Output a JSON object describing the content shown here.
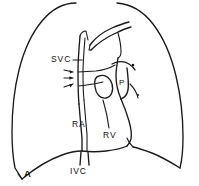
{
  "figure": {
    "panel_label": "A",
    "caption_text": "",
    "background_color": "#ffffff",
    "ink_color": "#1a1a1a",
    "width_px": 199,
    "height_px": 186,
    "style": "hand-drawn line diagram"
  },
  "labels": {
    "svc": "SVC",
    "pulmonary_artery": "P",
    "right_atrium": "RA",
    "right_ventricle": "RV",
    "ivc": "IVC"
  },
  "annotations": {
    "arrow_count": 3,
    "arrow_target": "azygos / superior vena cava border",
    "hilar_dot": "hilar point marker"
  },
  "structures": [
    {
      "name": "right-lung-outline",
      "label": ""
    },
    {
      "name": "left-lung-outline",
      "label": ""
    },
    {
      "name": "right-hemidiaphragm",
      "label": ""
    },
    {
      "name": "left-hemidiaphragm",
      "label": ""
    },
    {
      "name": "aortic-arch",
      "label": ""
    },
    {
      "name": "superior-vena-cava",
      "label": "SVC"
    },
    {
      "name": "pulmonary-artery",
      "label": "P"
    },
    {
      "name": "right-atrium",
      "label": "RA"
    },
    {
      "name": "right-ventricle",
      "label": "RV"
    },
    {
      "name": "inferior-vena-cava",
      "label": "IVC"
    },
    {
      "name": "aortic-root",
      "label": ""
    }
  ]
}
